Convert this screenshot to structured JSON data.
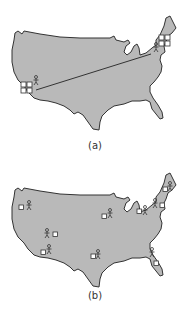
{
  "figure": {
    "panels": [
      {
        "id": "a",
        "caption": "(a)",
        "description": "Map of the continental United States with two clusters of servers (west coast and northeast) connected by a long line, each with one user",
        "server_clusters": [
          {
            "region": "west-coast",
            "count": 4
          },
          {
            "region": "northeast",
            "count": 4
          }
        ],
        "users": 2,
        "links": 1
      },
      {
        "id": "b",
        "caption": "(b)",
        "description": "Map of the continental United States with servers distributed near users across many locations",
        "sites": [
          {
            "region": "pacific-northwest"
          },
          {
            "region": "southwest-inland"
          },
          {
            "region": "southern-california"
          },
          {
            "region": "texas"
          },
          {
            "region": "midwest"
          },
          {
            "region": "great-lakes"
          },
          {
            "region": "mid-atlantic"
          },
          {
            "region": "new-england"
          },
          {
            "region": "florida"
          }
        ]
      }
    ]
  },
  "colors": {
    "land": "#b9b9b9",
    "outline": "#333333",
    "server_fill": "#ffffff",
    "background": "#ffffff"
  },
  "icons": {
    "server": "server-box-icon",
    "user": "stick-figure-user-icon"
  }
}
